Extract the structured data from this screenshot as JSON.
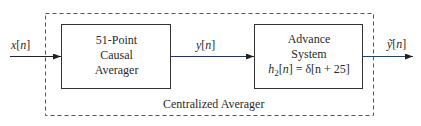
{
  "diagram": {
    "type": "block-diagram",
    "input_signal": {
      "name": "x",
      "index": "n"
    },
    "intermediate_signal": {
      "name": "y",
      "index": "n"
    },
    "output_signal": {
      "name": "ỹ",
      "index": "n"
    },
    "blocks": [
      {
        "id": "causal-averager",
        "lines": [
          "51-Point",
          "Causal",
          "Averager"
        ]
      },
      {
        "id": "advance-system",
        "lines": [
          "Advance",
          "System"
        ],
        "equation": {
          "lhs": "h",
          "sub": "2",
          "idx": "n",
          "rhs": "= δ[n + 25]"
        }
      }
    ],
    "group_label": "Centralized Averager"
  }
}
